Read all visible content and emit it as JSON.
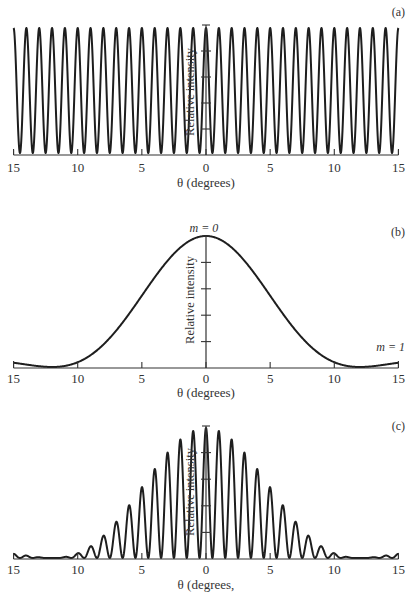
{
  "figure": {
    "panels": [
      {
        "id": "a",
        "label": "(a)",
        "xlabel": "θ (degrees)",
        "ylabel": "Relative intensity",
        "annotations": []
      },
      {
        "id": "b",
        "label": "(b)",
        "xlabel": "θ (degrees)",
        "ylabel": "Relative intensity",
        "annotations": [
          {
            "text": "m = 0",
            "position": "peak-center"
          },
          {
            "text": "m = 1",
            "position": "right-edge"
          }
        ]
      },
      {
        "id": "c",
        "label": "(c)",
        "xlabel": "θ (degrees,",
        "ylabel": "Relative intensity",
        "annotations": []
      }
    ],
    "x_tick_labels": [
      "15",
      "10",
      "5",
      "0",
      "5",
      "10",
      "15"
    ],
    "x_tick_values": [
      -15,
      -10,
      -5,
      0,
      5,
      10,
      15
    ],
    "colors": {
      "line": "#1e1e1e",
      "axis": "#333333",
      "background": "#ffffff"
    }
  },
  "chart_data": [
    {
      "type": "line",
      "title": "(a) Interference pattern (fringes)",
      "xlabel": "θ (degrees)",
      "ylabel": "Relative intensity",
      "xlim": [
        -15,
        15
      ],
      "ylim": [
        0,
        1
      ],
      "x_ticks": [
        -15,
        -10,
        -5,
        0,
        5,
        10,
        15
      ],
      "x_tick_labels": [
        "15",
        "10",
        "5",
        "0",
        "5",
        "10",
        "15"
      ],
      "y_ticks": [
        0,
        0.2,
        0.4,
        0.6,
        0.8,
        1.0
      ],
      "grid": false,
      "model": "I = cos^2(pi * theta / 1deg) — fringe maxima at every integer degree, minima at half-integers",
      "fringe_period_deg": 1,
      "peak_positions": [
        -15,
        -14,
        -13,
        -12,
        -11,
        -10,
        -9,
        -8,
        -7,
        -6,
        -5,
        -4,
        -3,
        -2,
        -1,
        0,
        1,
        2,
        3,
        4,
        5,
        6,
        7,
        8,
        9,
        10,
        11,
        12,
        13,
        14,
        15
      ],
      "peak_values": [
        1,
        1,
        1,
        1,
        1,
        1,
        1,
        1,
        1,
        1,
        1,
        1,
        1,
        1,
        1,
        1,
        1,
        1,
        1,
        1,
        1,
        1,
        1,
        1,
        1,
        1,
        1,
        1,
        1,
        1,
        1
      ]
    },
    {
      "type": "line",
      "title": "(b) Single-slit diffraction envelope",
      "xlabel": "θ (degrees)",
      "ylabel": "Relative intensity",
      "xlim": [
        -15,
        15
      ],
      "ylim": [
        0,
        1
      ],
      "x_ticks": [
        -15,
        -10,
        -5,
        0,
        5,
        10,
        15
      ],
      "x_tick_labels": [
        "15",
        "10",
        "5",
        "0",
        "5",
        "10",
        "15"
      ],
      "y_ticks": [
        0,
        0.2,
        0.4,
        0.6,
        0.8,
        1.0
      ],
      "grid": false,
      "model": "I = sinc^2(theta / 12deg), first zero near ±12°",
      "envelope_first_zero_deg": 12,
      "annotations": [
        {
          "text": "m = 0",
          "x": 0,
          "y": 1.0
        },
        {
          "text": "m = 1",
          "x": 15,
          "y": 0.04
        }
      ],
      "x": [
        -15,
        -14,
        -13,
        -12,
        -11,
        -10,
        -9,
        -8,
        -7,
        -6,
        -5,
        -4,
        -3,
        -2,
        -1,
        0,
        1,
        2,
        3,
        4,
        5,
        6,
        7,
        8,
        9,
        10,
        11,
        12,
        13,
        14,
        15
      ],
      "values": [
        0.03,
        0.02,
        0.005,
        0,
        0.006,
        0.04,
        0.09,
        0.17,
        0.27,
        0.41,
        0.54,
        0.68,
        0.81,
        0.91,
        0.98,
        1.0,
        0.98,
        0.91,
        0.81,
        0.68,
        0.54,
        0.41,
        0.27,
        0.17,
        0.09,
        0.04,
        0.006,
        0,
        0.005,
        0.02,
        0.03
      ]
    },
    {
      "type": "line",
      "title": "(c) Combined double-slit pattern",
      "xlabel": "θ (degrees)",
      "ylabel": "Relative intensity",
      "xlim": [
        -15,
        15
      ],
      "ylim": [
        0,
        1
      ],
      "x_ticks": [
        -15,
        -10,
        -5,
        0,
        5,
        10,
        15
      ],
      "x_tick_labels": [
        "15",
        "10",
        "5",
        "0",
        "5",
        "10",
        "15"
      ],
      "y_ticks": [
        0,
        0.2,
        0.4,
        0.6,
        0.8,
        1.0
      ],
      "grid": false,
      "model": "I = cos^2(pi*theta) * sinc^2(theta/12)",
      "peak_positions": [
        -15,
        -14,
        -13,
        -12,
        -11,
        -10,
        -9,
        -8,
        -7,
        -6,
        -5,
        -4,
        -3,
        -2,
        -1,
        0,
        1,
        2,
        3,
        4,
        5,
        6,
        7,
        8,
        9,
        10,
        11,
        12,
        13,
        14,
        15
      ],
      "peak_values": [
        0.03,
        0.02,
        0.005,
        0,
        0.006,
        0.04,
        0.08,
        0.16,
        0.26,
        0.38,
        0.52,
        0.67,
        0.8,
        0.9,
        0.97,
        1.0,
        0.97,
        0.9,
        0.8,
        0.67,
        0.52,
        0.38,
        0.26,
        0.16,
        0.08,
        0.04,
        0.006,
        0,
        0.005,
        0.02,
        0.03
      ]
    }
  ]
}
